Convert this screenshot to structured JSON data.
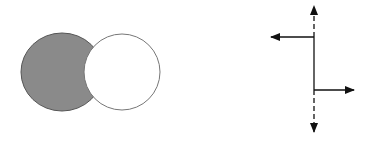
{
  "diagram": {
    "left_figure": {
      "description": "gray ellipse partially occluded by white circle",
      "ellipse": {
        "cx": 62,
        "cy": 72,
        "rx": 41,
        "ry": 39,
        "fill": "#8a8a8a",
        "stroke": "#555555"
      },
      "circle": {
        "cx": 122,
        "cy": 72,
        "r": 38,
        "fill": "#ffffff",
        "stroke": "#777777"
      }
    },
    "right_figure": {
      "description": "step line with dashed vertical axis and horizontal arrows",
      "axis_x": 314,
      "dashed_top": {
        "y1": 37,
        "y2": 6
      },
      "solid_segment": {
        "y1": 37,
        "y2": 90
      },
      "dashed_bottom": {
        "y1": 90,
        "y2": 132
      },
      "left_arrow": {
        "y": 37,
        "x_start": 314,
        "x_end": 270
      },
      "right_arrow": {
        "y": 90,
        "x_start": 314,
        "x_end": 354
      },
      "stroke": "#111111"
    }
  }
}
